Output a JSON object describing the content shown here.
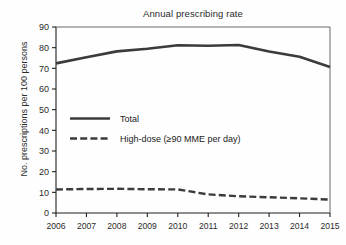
{
  "chart_data": {
    "type": "line",
    "title": "Annual prescribing rate",
    "xlabel": "",
    "ylabel": "No. prescriptions per 100 persons",
    "categories": [
      "2006",
      "2007",
      "2008",
      "2009",
      "2010",
      "2011",
      "2012",
      "2013",
      "2014",
      "2015"
    ],
    "x": [
      2006,
      2007,
      2008,
      2009,
      2010,
      2011,
      2012,
      2013,
      2014,
      2015
    ],
    "xlim": [
      2006,
      2015
    ],
    "ylim": [
      0,
      90
    ],
    "yticks": [
      0,
      10,
      20,
      30,
      40,
      50,
      60,
      70,
      80,
      90
    ],
    "ytick_labels": [
      "0",
      "10",
      "20",
      "30",
      "40",
      "50",
      "60",
      "70",
      "80",
      "90"
    ],
    "grid": false,
    "legend_position": "center-left",
    "series": [
      {
        "name": "Total",
        "style": "solid",
        "color": "#3b3b3b",
        "values": [
          72.4,
          75.4,
          78.2,
          79.5,
          81.2,
          80.9,
          81.3,
          78.1,
          75.6,
          70.6
        ]
      },
      {
        "name": "High-dose (≥90 MME per day)",
        "style": "dashed",
        "color": "#3b3b3b",
        "values": [
          11.4,
          11.6,
          11.7,
          11.5,
          11.4,
          9.0,
          8.1,
          7.6,
          7.1,
          6.5
        ]
      }
    ]
  },
  "legend": {
    "entries": [
      {
        "label": "Total"
      },
      {
        "label": "High-dose (≥90 MME per day)"
      }
    ]
  }
}
